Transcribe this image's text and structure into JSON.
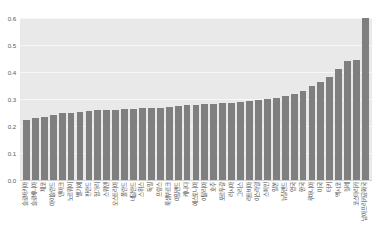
{
  "chart_data": {
    "type": "bar",
    "title": "",
    "subtitle": "",
    "xlabel": "",
    "ylabel": "",
    "ylim": [
      0.0,
      0.6
    ],
    "yticks": [
      "0.0",
      "0.1",
      "0.2",
      "0.3",
      "0.4",
      "0.5",
      "0.6"
    ],
    "ytick_values": [
      0.0,
      0.1,
      0.2,
      0.3,
      0.4,
      0.5,
      0.6
    ],
    "grid": true,
    "legend": "none",
    "bar_color": "#7f7f7f",
    "plot_background": "#e9e9e9",
    "gridline_color": "#f7f7f7",
    "sorted": "ascending",
    "categories": [
      "슬로바키아",
      "슬로베니아",
      "체코",
      "아이슬란드",
      "덴마크",
      "노르웨이",
      "벨기에",
      "핀란드",
      "헝가리",
      "스웨덴",
      "오스트리아",
      "폴란드",
      "네덜란드",
      "스위스",
      "독일",
      "프랑스",
      "룩셈부르크",
      "아일랜드",
      "캐나다",
      "에스토니아",
      "이탈리아",
      "호주",
      "포르투갈",
      "러시아",
      "그리스",
      "라트비아",
      "이스라엘",
      "스페인",
      "일본",
      "뉴질랜드",
      "영국",
      "한국",
      "루마니아",
      "미국",
      "터키",
      "멕시코",
      "칠레",
      "코스타리카",
      "남아프리카공화국"
    ],
    "values": [
      0.222,
      0.228,
      0.235,
      0.24,
      0.247,
      0.25,
      0.252,
      0.255,
      0.258,
      0.26,
      0.261,
      0.262,
      0.264,
      0.265,
      0.267,
      0.268,
      0.27,
      0.273,
      0.276,
      0.278,
      0.281,
      0.283,
      0.285,
      0.287,
      0.29,
      0.293,
      0.296,
      0.3,
      0.305,
      0.31,
      0.32,
      0.331,
      0.35,
      0.363,
      0.38,
      0.41,
      0.44,
      0.445,
      0.6
    ]
  }
}
